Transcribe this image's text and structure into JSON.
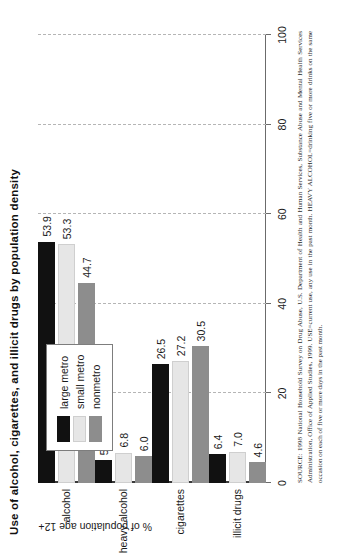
{
  "chart_data": {
    "type": "bar",
    "orientation": "vertical",
    "title": "Use of alcohol, cigarettes, and illicit drugs by population density",
    "xlabel": "",
    "ylabel": "% of population age 12+",
    "categories": [
      "alcohol",
      "heavy alcohol",
      "cigarettes",
      "illicit drugs"
    ],
    "series": [
      {
        "name": "large metro",
        "color": "#111111",
        "values": [
          53.9,
          5.1,
          26.5,
          6.4
        ]
      },
      {
        "name": "small metro",
        "color": "#e6e6e6",
        "values": [
          53.3,
          6.8,
          27.2,
          7.0
        ]
      },
      {
        "name": "nonmetro",
        "color": "#8d8d8d",
        "values": [
          44.7,
          6.0,
          30.5,
          4.6
        ]
      }
    ],
    "ylim": [
      0,
      100
    ],
    "yticks": [
      0,
      20,
      40,
      60,
      80,
      100
    ],
    "ytick_labels": [
      "0",
      "20",
      "40",
      "60",
      "80",
      "100"
    ],
    "grid": "dashed vertical gridlines at each tick",
    "legend_position": "upper right",
    "data_labels": true
  },
  "legend": {
    "items": [
      {
        "label": "large metro"
      },
      {
        "label": "small metro"
      },
      {
        "label": "nonmetro"
      }
    ]
  },
  "source": {
    "text": "SOURCE: 1998 National Household Survey on Drug Abuse, U.S. Department of Health and Human Services, Substance Abuse and Mental Health Services Administration, Office of Applied Studies, 1999. USE=current use, any use in the past month. HEAVY ALCOHOL=drinking five or more drinks on the same occasion on each of five or more days in the past month."
  }
}
